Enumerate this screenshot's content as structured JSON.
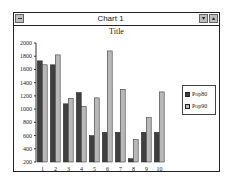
{
  "window": {
    "title": "Chart 1"
  },
  "chart_data": {
    "type": "bar",
    "title": "Title",
    "xlabel": "",
    "ylabel": "",
    "categories": [
      "1",
      "2",
      "3",
      "4",
      "5",
      "6",
      "7",
      "8",
      "9",
      "10"
    ],
    "series": [
      {
        "name": "Pop80",
        "color": "#404040",
        "values": [
          1730,
          1670,
          1080,
          1250,
          600,
          650,
          650,
          250,
          650,
          650
        ]
      },
      {
        "name": "Pop90",
        "color": "#b8b8b8",
        "values": [
          1670,
          1820,
          1160,
          1040,
          1170,
          1880,
          1300,
          540,
          870,
          1260
        ]
      }
    ],
    "ylim": [
      200,
      2000
    ],
    "yticks": [
      "2000",
      "1800",
      "1600",
      "1400",
      "1200",
      "1000",
      "800",
      "600",
      "400",
      "200"
    ],
    "grid": false,
    "legend_position": "right"
  }
}
